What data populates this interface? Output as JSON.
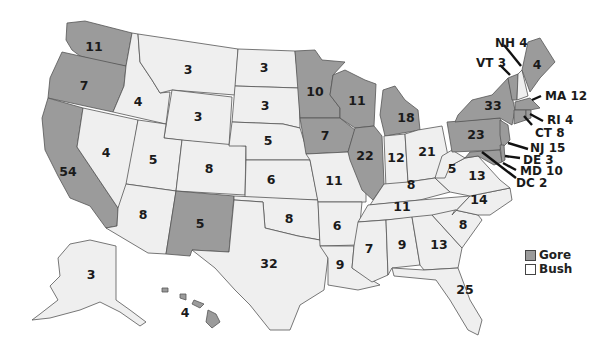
{
  "map": {
    "title": "",
    "subject": "2000 U.S. Presidential Election Electoral Votes by State",
    "colors": {
      "gore": "#9b9b9b",
      "bush": "#efefef",
      "border": "#555555"
    },
    "legend": [
      {
        "party": "gore",
        "label": "Gore",
        "color": "#9b9b9b"
      },
      {
        "party": "bush",
        "label": "Bush",
        "color": "#efefef"
      }
    ],
    "states": {
      "WA": {
        "votes": "11",
        "winner": "gore"
      },
      "OR": {
        "votes": "7",
        "winner": "gore"
      },
      "CA": {
        "votes": "54",
        "winner": "gore"
      },
      "ID": {
        "votes": "4",
        "winner": "bush"
      },
      "NV": {
        "votes": "4",
        "winner": "bush"
      },
      "MT": {
        "votes": "3",
        "winner": "bush"
      },
      "WY": {
        "votes": "3",
        "winner": "bush"
      },
      "UT": {
        "votes": "5",
        "winner": "bush"
      },
      "AZ": {
        "votes": "8",
        "winner": "bush"
      },
      "CO": {
        "votes": "8",
        "winner": "bush"
      },
      "NM": {
        "votes": "5",
        "winner": "gore"
      },
      "ND": {
        "votes": "3",
        "winner": "bush"
      },
      "SD": {
        "votes": "3",
        "winner": "bush"
      },
      "NE": {
        "votes": "5",
        "winner": "bush"
      },
      "KS": {
        "votes": "6",
        "winner": "bush"
      },
      "OK": {
        "votes": "8",
        "winner": "bush"
      },
      "TX": {
        "votes": "32",
        "winner": "bush"
      },
      "MN": {
        "votes": "10",
        "winner": "gore"
      },
      "IA": {
        "votes": "7",
        "winner": "gore"
      },
      "MO": {
        "votes": "11",
        "winner": "bush"
      },
      "AR": {
        "votes": "6",
        "winner": "bush"
      },
      "LA": {
        "votes": "9",
        "winner": "bush"
      },
      "WI": {
        "votes": "11",
        "winner": "gore"
      },
      "IL": {
        "votes": "22",
        "winner": "gore"
      },
      "MI": {
        "votes": "18",
        "winner": "gore"
      },
      "IN": {
        "votes": "12",
        "winner": "bush"
      },
      "OH": {
        "votes": "21",
        "winner": "bush"
      },
      "KY": {
        "votes": "8",
        "winner": "bush"
      },
      "TN": {
        "votes": "11",
        "winner": "bush"
      },
      "MS": {
        "votes": "7",
        "winner": "bush"
      },
      "AL": {
        "votes": "9",
        "winner": "bush"
      },
      "GA": {
        "votes": "13",
        "winner": "bush"
      },
      "FL": {
        "votes": "25",
        "winner": "bush"
      },
      "SC": {
        "votes": "8",
        "winner": "bush"
      },
      "NC": {
        "votes": "14",
        "winner": "bush"
      },
      "VA": {
        "votes": "13",
        "winner": "bush"
      },
      "WV": {
        "votes": "5",
        "winner": "bush"
      },
      "PA": {
        "votes": "23",
        "winner": "gore"
      },
      "NY": {
        "votes": "33",
        "winner": "gore"
      },
      "ME": {
        "votes": "4",
        "winner": "gore"
      },
      "AK": {
        "votes": "3",
        "winner": "bush"
      },
      "HI": {
        "votes": "4",
        "winner": "gore"
      }
    },
    "callouts": {
      "NH": {
        "label": "NH 4",
        "winner": "bush"
      },
      "VT": {
        "label": "VT 3",
        "winner": "gore"
      },
      "MA": {
        "label": "MA 12",
        "winner": "gore"
      },
      "RI": {
        "label": "RI 4",
        "winner": "gore"
      },
      "CT": {
        "label": "CT 8",
        "winner": "gore"
      },
      "NJ": {
        "label": "NJ 15",
        "winner": "gore"
      },
      "DE": {
        "label": "DE 3",
        "winner": "gore"
      },
      "MD": {
        "label": "MD 10",
        "winner": "gore"
      },
      "DC": {
        "label": "DC 2",
        "winner": "gore"
      }
    }
  }
}
